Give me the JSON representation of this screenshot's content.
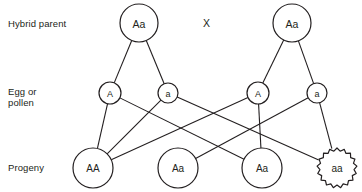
{
  "figure": {
    "row_labels": {
      "parent": "Hybrid parent",
      "gamete": "Egg or\npollen",
      "progeny": "Progeny"
    },
    "cross_symbol": "X",
    "stroke_color": "#231f20",
    "background_color": "#ffffff"
  },
  "nodes": {
    "parents": [
      {
        "id": "parent-left",
        "label": "Aa",
        "cx": 139,
        "cy": 23,
        "r": 19,
        "style": "solid",
        "font": 10.5
      },
      {
        "id": "parent-right",
        "label": "Aa",
        "cx": 292,
        "cy": 23,
        "r": 19,
        "style": "solid",
        "font": 10.5
      }
    ],
    "gametes": [
      {
        "id": "gamete-left-A",
        "label": "A",
        "cx": 110,
        "cy": 93,
        "r": 11,
        "style": "solid",
        "font": 9
      },
      {
        "id": "gamete-left-a",
        "label": "a",
        "cx": 168,
        "cy": 93,
        "r": 10,
        "style": "solid",
        "font": 9
      },
      {
        "id": "gamete-right-A",
        "label": "A",
        "cx": 258,
        "cy": 93,
        "r": 11,
        "style": "solid",
        "font": 9
      },
      {
        "id": "gamete-right-a",
        "label": "a",
        "cx": 317,
        "cy": 93,
        "r": 10,
        "style": "solid",
        "font": 9
      }
    ],
    "progeny": [
      {
        "id": "progeny-AA",
        "label": "AA",
        "cx": 93,
        "cy": 168,
        "r": 20,
        "style": "solid",
        "font": 10
      },
      {
        "id": "progeny-Aa-1",
        "label": "Aa",
        "cx": 178,
        "cy": 168,
        "r": 20,
        "style": "solid",
        "font": 10
      },
      {
        "id": "progeny-Aa-2",
        "label": "Aa",
        "cx": 262,
        "cy": 168,
        "r": 20,
        "style": "solid",
        "font": 10
      },
      {
        "id": "progeny-aa",
        "label": "aa",
        "cx": 337,
        "cy": 168,
        "r": 20,
        "style": "scalloped",
        "font": 10
      }
    ]
  },
  "edges": [
    {
      "from": "parent-left",
      "to": "gamete-left-A"
    },
    {
      "from": "parent-left",
      "to": "gamete-left-a"
    },
    {
      "from": "parent-right",
      "to": "gamete-right-A"
    },
    {
      "from": "parent-right",
      "to": "gamete-right-a"
    },
    {
      "from": "gamete-left-A",
      "to": "progeny-AA"
    },
    {
      "from": "gamete-left-A",
      "to": "progeny-Aa-2"
    },
    {
      "from": "gamete-left-a",
      "to": "progeny-AA"
    },
    {
      "from": "gamete-left-a",
      "to": "progeny-aa"
    },
    {
      "from": "gamete-right-A",
      "to": "progeny-AA"
    },
    {
      "from": "gamete-right-A",
      "to": "progeny-Aa-2"
    },
    {
      "from": "gamete-right-a",
      "to": "progeny-Aa-1"
    },
    {
      "from": "gamete-right-a",
      "to": "progeny-aa"
    }
  ]
}
